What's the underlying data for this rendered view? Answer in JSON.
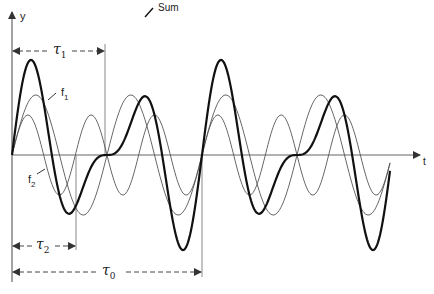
{
  "diagram": {
    "title": "",
    "axes": {
      "y_label": "y",
      "x_label": "t"
    },
    "curves": [
      {
        "id": "f1",
        "label": "f1",
        "label_main": "f",
        "label_sub": "1",
        "amplitude": 60,
        "cycles_per_tau0": 2,
        "stroke": "#555555",
        "width": 0.9
      },
      {
        "id": "f2",
        "label": "f2",
        "label_main": "f",
        "label_sub": "2",
        "amplitude": 40,
        "cycles_per_tau0": 3,
        "stroke": "#555555",
        "width": 0.9
      },
      {
        "id": "sum",
        "label": "Sum",
        "stroke": "#111111",
        "width": 2.2
      }
    ],
    "periods": [
      {
        "id": "tau1",
        "label_main": "τ",
        "label_sub": "1",
        "description": "period of f1"
      },
      {
        "id": "tau2",
        "label_main": "τ",
        "label_sub": "2",
        "description": "period of f2"
      },
      {
        "id": "tau0",
        "label_main": "τ",
        "label_sub": "0",
        "description": "period of Sum"
      }
    ],
    "labels": {
      "sum": "Sum",
      "f1_main": "f",
      "f1_sub": "1",
      "f2_main": "f",
      "f2_sub": "2",
      "tau1_main": "τ",
      "tau1_sub": "1",
      "tau2_main": "τ",
      "tau2_sub": "2",
      "tau0_main": "τ",
      "tau0_sub": "0",
      "y": "y",
      "t": "t"
    },
    "geometry": {
      "origin_x": 12,
      "axis_y": 155,
      "tau0_px": 190,
      "x_end": 390,
      "colors": {
        "axis": "#666666",
        "thin_curve": "#555555",
        "sum_curve": "#111111",
        "text": "#222222"
      }
    }
  }
}
